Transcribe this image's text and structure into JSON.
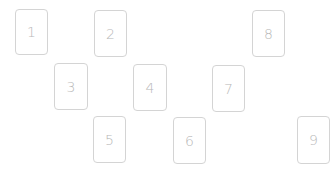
{
  "cards": [
    {
      "label": "1",
      "x": 15,
      "y": 9,
      "w": 33,
      "h": 46
    },
    {
      "label": "2",
      "x": 94,
      "y": 10,
      "w": 33,
      "h": 47
    },
    {
      "label": "3",
      "x": 54,
      "y": 63,
      "w": 34,
      "h": 47
    },
    {
      "label": "4",
      "x": 133,
      "y": 64,
      "w": 34,
      "h": 47
    },
    {
      "label": "5",
      "x": 93,
      "y": 116,
      "w": 33,
      "h": 47
    },
    {
      "label": "6",
      "x": 173,
      "y": 117,
      "w": 33,
      "h": 47
    },
    {
      "label": "7",
      "x": 212,
      "y": 65,
      "w": 33,
      "h": 47
    },
    {
      "label": "8",
      "x": 252,
      "y": 10,
      "w": 33,
      "h": 47
    },
    {
      "label": "9",
      "x": 297,
      "y": 116,
      "w": 33,
      "h": 48
    }
  ]
}
